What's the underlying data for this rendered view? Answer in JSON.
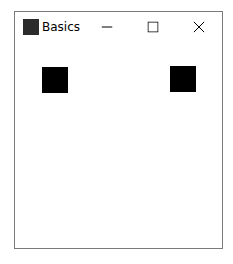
{
  "window": {
    "title": "Basics",
    "controls": {
      "minimize": "minimize-icon",
      "maximize": "maximize-icon",
      "close": "close-icon"
    }
  },
  "content": {
    "shapes": [
      {
        "type": "square",
        "color": "#000000"
      },
      {
        "type": "square",
        "color": "#000000"
      }
    ]
  }
}
